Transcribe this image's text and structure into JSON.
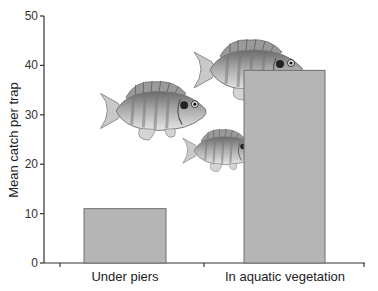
{
  "chart_data": {
    "type": "bar",
    "title": "",
    "xlabel": "",
    "ylabel": "Mean catch per trap",
    "categories": [
      "Under piers",
      "In aquatic vegetation"
    ],
    "values": [
      11,
      39
    ],
    "ylim": [
      0,
      50
    ],
    "yticks": [
      0,
      10,
      20,
      30,
      40,
      50
    ],
    "grid": false,
    "legend": null,
    "bar_color": "#b5b5b5",
    "bar_edge_color": "#6e6e6e",
    "annotations": [
      "Illustration of three bluegill sunfish swimming toward the aquatic vegetation bar"
    ]
  },
  "colors": {
    "axis": "#333333",
    "bar_fill": "#b5b5b5",
    "bar_edge": "#6e6e6e"
  }
}
